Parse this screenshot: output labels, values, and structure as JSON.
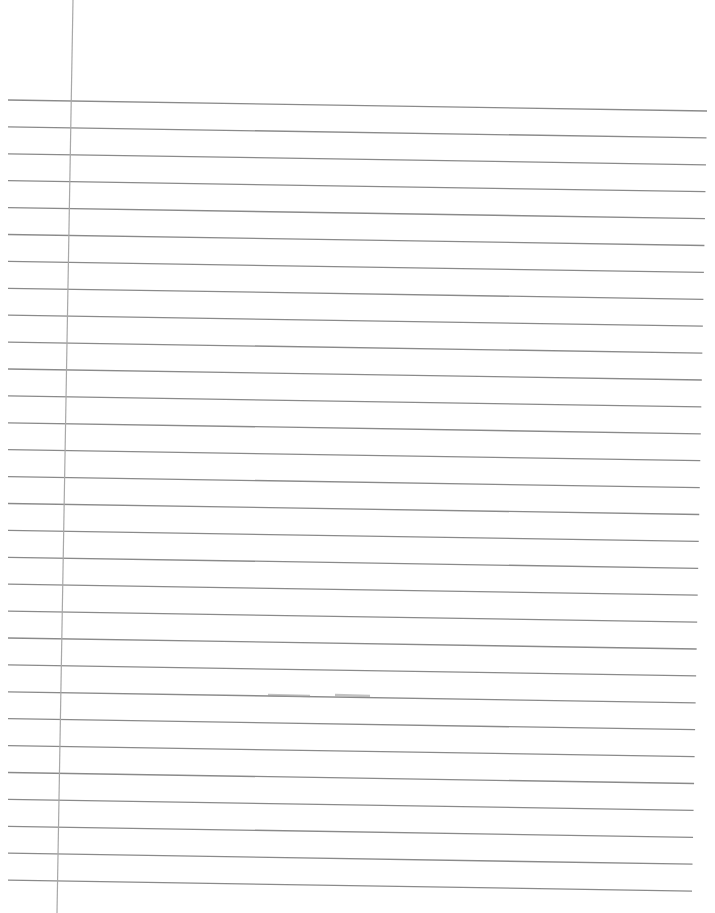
{
  "page": {
    "type": "lined-notebook-paper",
    "background": "#ffffff",
    "rule_color": "#8a8a8a",
    "margin_color": "#a8a8a8",
    "rule_count": 30,
    "rule_start_left_y": 100,
    "rule_start_right_y": 111,
    "rule_spacing": 26.9,
    "rule_left_x": 8,
    "rule_right_x_top": 707,
    "rule_right_x_bottom": 692,
    "margin_line": {
      "x_top": 73,
      "y_top": 0,
      "x_bottom": 57,
      "y_bottom": 913
    },
    "content": ""
  }
}
